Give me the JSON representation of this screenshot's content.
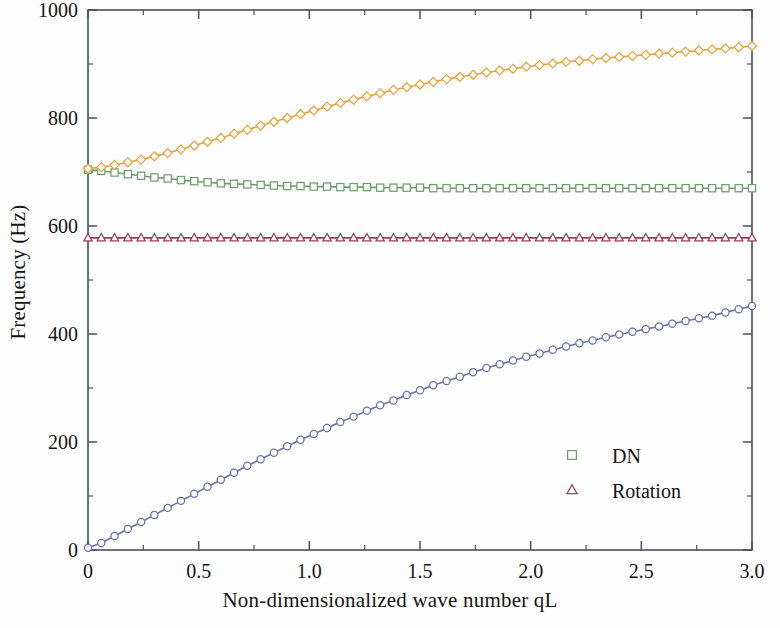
{
  "chart_data": {
    "type": "line",
    "title": "",
    "xlabel": "Non-dimensionalized wave number qL",
    "ylabel": "Frequency (Hz)",
    "xlim": [
      0,
      3.0
    ],
    "ylim": [
      0,
      1000
    ],
    "xticks": [
      "0",
      "0.5",
      "1.0",
      "1.5",
      "2.0",
      "2.5",
      "3.0"
    ],
    "xtick_values": [
      0,
      0.5,
      1.0,
      1.5,
      2.0,
      2.5,
      3.0
    ],
    "yticks": [
      "0",
      "200",
      "400",
      "600",
      "800",
      "1000"
    ],
    "ytick_values": [
      0,
      200,
      400,
      600,
      800,
      1000
    ],
    "minor_tick_count": 1,
    "grid": false,
    "legend_position": "lower right",
    "legend": [
      {
        "label": "DN",
        "marker": "open-square",
        "color": "#6d9e6d"
      },
      {
        "label": "Rotation",
        "marker": "open-triangle",
        "color": "#9e3b5a"
      }
    ],
    "series": [
      {
        "name": "DN",
        "marker": "open-square",
        "color": "#6d9e6d",
        "x": [
          0.0,
          0.06,
          0.12,
          0.18,
          0.24,
          0.3,
          0.36,
          0.42,
          0.48,
          0.54,
          0.6,
          0.66,
          0.72,
          0.78,
          0.84,
          0.9,
          0.96,
          1.02,
          1.08,
          1.14,
          1.2,
          1.26,
          1.32,
          1.38,
          1.44,
          1.5,
          1.56,
          1.62,
          1.68,
          1.74,
          1.8,
          1.86,
          1.92,
          1.98,
          2.04,
          2.1,
          2.16,
          2.22,
          2.28,
          2.34,
          2.4,
          2.46,
          2.52,
          2.58,
          2.64,
          2.7,
          2.76,
          2.82,
          2.88,
          2.94,
          3.0
        ],
        "y": [
          704,
          702,
          699,
          696,
          693,
          690,
          688,
          685,
          683,
          681,
          679,
          678,
          677,
          676,
          675,
          674,
          674,
          673,
          673,
          672,
          672,
          672,
          671,
          671,
          671,
          671,
          670,
          670,
          670,
          670,
          670,
          670,
          670,
          670,
          670,
          670,
          670,
          670,
          670,
          670,
          670,
          670,
          670,
          670,
          670,
          670,
          670,
          670,
          670,
          670,
          670
        ]
      },
      {
        "name": "Rotation",
        "marker": "open-triangle",
        "color": "#9e3b5a",
        "x": [
          0.0,
          0.06,
          0.12,
          0.18,
          0.24,
          0.3,
          0.36,
          0.42,
          0.48,
          0.54,
          0.6,
          0.66,
          0.72,
          0.78,
          0.84,
          0.9,
          0.96,
          1.02,
          1.08,
          1.14,
          1.2,
          1.26,
          1.32,
          1.38,
          1.44,
          1.5,
          1.56,
          1.62,
          1.68,
          1.74,
          1.8,
          1.86,
          1.92,
          1.98,
          2.04,
          2.1,
          2.16,
          2.22,
          2.28,
          2.34,
          2.4,
          2.46,
          2.52,
          2.58,
          2.64,
          2.7,
          2.76,
          2.82,
          2.88,
          2.94,
          3.0
        ],
        "y": [
          578,
          578,
          578,
          578,
          578,
          578,
          578,
          578,
          578,
          578,
          578,
          578,
          578,
          578,
          578,
          578,
          578,
          578,
          578,
          578,
          578,
          578,
          578,
          578,
          578,
          578,
          578,
          578,
          578,
          578,
          578,
          578,
          578,
          578,
          578,
          578,
          578,
          578,
          578,
          578,
          578,
          578,
          578,
          578,
          578,
          578,
          578,
          578,
          578,
          578,
          578
        ]
      },
      {
        "name": "upper-branch",
        "marker": "open-diamond",
        "color": "#e8a33d",
        "x": [
          0.0,
          0.06,
          0.12,
          0.18,
          0.24,
          0.3,
          0.36,
          0.42,
          0.48,
          0.54,
          0.6,
          0.66,
          0.72,
          0.78,
          0.84,
          0.9,
          0.96,
          1.02,
          1.08,
          1.14,
          1.2,
          1.26,
          1.32,
          1.38,
          1.44,
          1.5,
          1.56,
          1.62,
          1.68,
          1.74,
          1.8,
          1.86,
          1.92,
          1.98,
          2.04,
          2.1,
          2.16,
          2.22,
          2.28,
          2.34,
          2.4,
          2.46,
          2.52,
          2.58,
          2.64,
          2.7,
          2.76,
          2.82,
          2.88,
          2.94,
          3.0
        ],
        "y": [
          706,
          709,
          713,
          718,
          723,
          729,
          735,
          742,
          749,
          756,
          763,
          771,
          778,
          786,
          793,
          800,
          807,
          814,
          821,
          828,
          834,
          840,
          846,
          852,
          857,
          862,
          867,
          872,
          876,
          880,
          884,
          888,
          891,
          895,
          898,
          901,
          904,
          906,
          909,
          911,
          913,
          915,
          917,
          919,
          921,
          923,
          925,
          927,
          929,
          931,
          933
        ]
      },
      {
        "name": "lower-branch",
        "marker": "open-circle",
        "color": "#6771a8",
        "x": [
          0.0,
          0.06,
          0.12,
          0.18,
          0.24,
          0.3,
          0.36,
          0.42,
          0.48,
          0.54,
          0.6,
          0.66,
          0.72,
          0.78,
          0.84,
          0.9,
          0.96,
          1.02,
          1.08,
          1.14,
          1.2,
          1.26,
          1.32,
          1.38,
          1.44,
          1.5,
          1.56,
          1.62,
          1.68,
          1.74,
          1.8,
          1.86,
          1.92,
          1.98,
          2.04,
          2.1,
          2.16,
          2.22,
          2.28,
          2.34,
          2.4,
          2.46,
          2.52,
          2.58,
          2.64,
          2.7,
          2.76,
          2.82,
          2.88,
          2.94,
          3.0
        ],
        "y": [
          4,
          13,
          26,
          39,
          52,
          65,
          78,
          91,
          104,
          117,
          130,
          143,
          156,
          168,
          180,
          192,
          204,
          215,
          226,
          237,
          247,
          258,
          268,
          277,
          287,
          296,
          305,
          313,
          321,
          329,
          337,
          344,
          351,
          358,
          364,
          371,
          377,
          383,
          388,
          394,
          399,
          404,
          409,
          414,
          419,
          424,
          429,
          434,
          440,
          446,
          452
        ]
      }
    ]
  },
  "geometry": {
    "plot_left": 88,
    "plot_right": 752,
    "plot_top": 10,
    "plot_bottom": 550,
    "frame_color": "#4a4f5e",
    "frame_width": 1.6
  }
}
